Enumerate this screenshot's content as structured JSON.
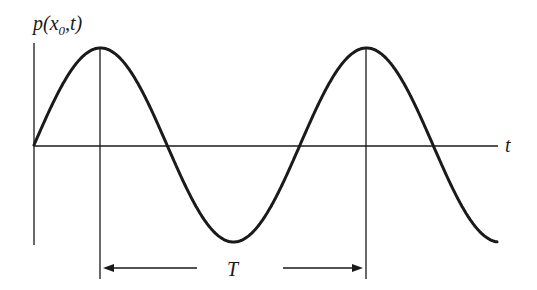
{
  "diagram": {
    "y_axis_label": "p(x",
    "y_axis_label_sub": "0",
    "y_axis_label_end": ",t)",
    "x_axis_label": "t",
    "period_label": "T",
    "colors": {
      "ink": "#1a1a1a",
      "background": "#ffffff"
    },
    "wave": {
      "type": "sine",
      "origin_px": [
        34,
        145
      ],
      "period_px": 266,
      "amplitude_px": 97,
      "end_x_px": 497
    },
    "markers": [
      {
        "name": "first-peak",
        "x_px": 100
      },
      {
        "name": "second-peak",
        "x_px": 366
      }
    ]
  }
}
